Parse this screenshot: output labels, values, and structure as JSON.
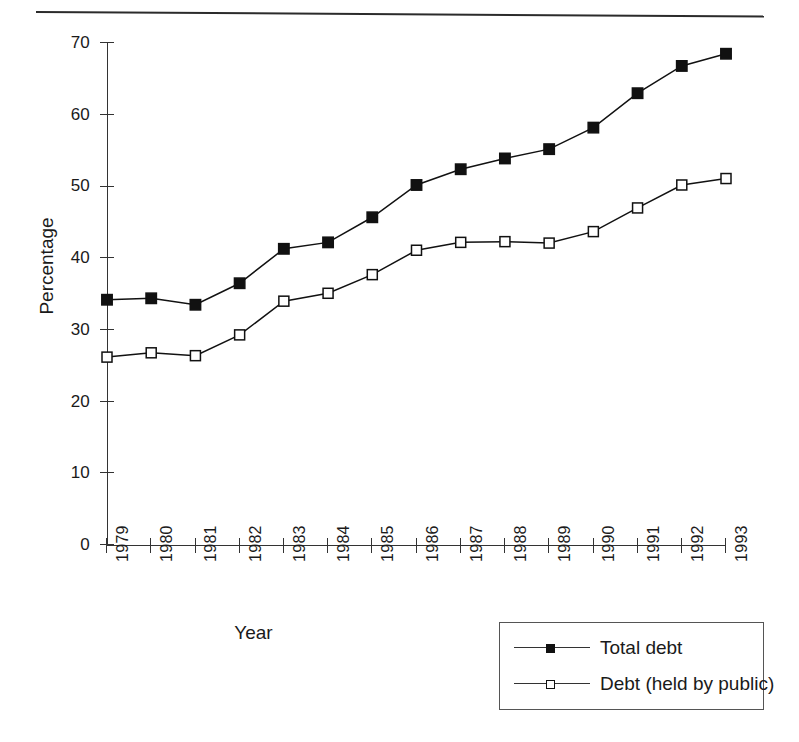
{
  "figure": {
    "top_rule": "horizontal-rule"
  },
  "axes": {
    "y_title": "Percentage",
    "x_title": "Year",
    "y_ticks": [
      "0",
      "10",
      "20",
      "30",
      "40",
      "50",
      "60",
      "70"
    ],
    "x_ticks": [
      "1979",
      "1980",
      "1981",
      "1982",
      "1983",
      "1984",
      "1985",
      "1986",
      "1987",
      "1988",
      "1989",
      "1990",
      "1991",
      "1992",
      "1993"
    ]
  },
  "legend": {
    "items": [
      {
        "label": "Total debt",
        "marker": "filled-square",
        "color": "#111111"
      },
      {
        "label": "Debt (held by public)",
        "marker": "open-square",
        "color": "#111111"
      }
    ]
  },
  "chart_data": {
    "type": "line",
    "title": "",
    "subtitle": "",
    "xlabel": "Year",
    "ylabel": "Percentage",
    "xlim": [
      1979,
      1993
    ],
    "ylim": [
      0,
      70
    ],
    "y_tick_step": 10,
    "grid": false,
    "legend_position": "bottom-right",
    "categories": [
      "1979",
      "1980",
      "1981",
      "1982",
      "1983",
      "1984",
      "1985",
      "1986",
      "1987",
      "1988",
      "1989",
      "1990",
      "1991",
      "1992",
      "1993"
    ],
    "x": [
      1979,
      1980,
      1981,
      1982,
      1983,
      1984,
      1985,
      1986,
      1987,
      1988,
      1989,
      1990,
      1991,
      1992,
      1993
    ],
    "series": [
      {
        "name": "Total debt",
        "marker": "filled-square",
        "color": "#111111",
        "values": [
          34.2,
          34.4,
          33.5,
          36.5,
          41.3,
          42.2,
          45.7,
          50.2,
          52.4,
          53.9,
          55.2,
          58.2,
          63.0,
          66.8,
          68.5
        ]
      },
      {
        "name": "Debt (held by public)",
        "marker": "open-square",
        "color": "#111111",
        "values": [
          26.2,
          26.8,
          26.4,
          29.3,
          34.0,
          35.1,
          37.7,
          41.1,
          42.2,
          42.3,
          42.1,
          43.7,
          47.0,
          50.2,
          51.1
        ]
      }
    ]
  }
}
